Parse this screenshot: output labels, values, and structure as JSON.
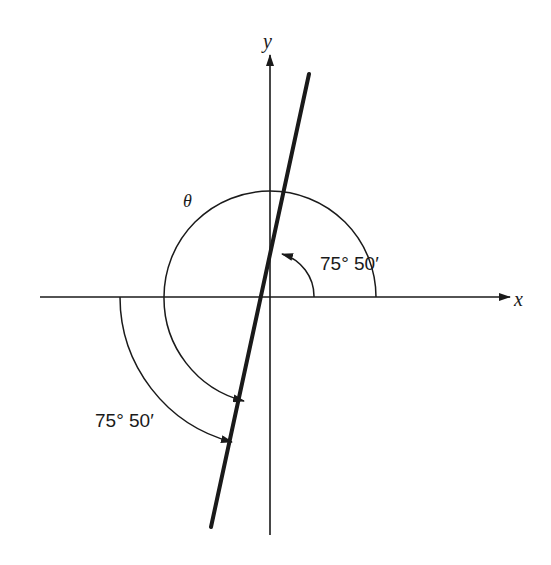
{
  "diagram": {
    "title": "",
    "axes": {
      "x_label": "x",
      "y_label": "y"
    },
    "angle_symbol": "θ",
    "labels": {
      "upper_angle": "75° 50′",
      "lower_angle": "75° 50′"
    },
    "line": {
      "description": "line through origin at 75°50′ to positive x-axis"
    },
    "colors": {
      "stroke": "#1a1a1a",
      "background": "#ffffff"
    }
  }
}
